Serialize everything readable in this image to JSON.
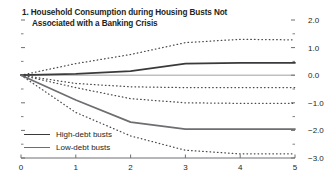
{
  "chart_data": {
    "type": "line",
    "title": "1. Household Consumption during Housing Busts Not Associated with a Banking Crisis",
    "title_line1": "1. Household Consumption during Housing Busts Not",
    "title_line2": "Associated with a Banking Crisis",
    "xlabel": "",
    "ylabel": "",
    "x": [
      0,
      1,
      2,
      3,
      4,
      5
    ],
    "xlim": [
      0,
      5
    ],
    "ylim": [
      -3.0,
      2.0
    ],
    "xticks": [
      "0",
      "1",
      "2",
      "3",
      "4",
      "5"
    ],
    "yticks": [
      "2.0",
      "1.0",
      "0.0",
      "-1.0",
      "-2.0",
      "-3.0"
    ],
    "ytick_values": [
      2.0,
      1.0,
      0.0,
      -1.0,
      -2.0,
      -3.0
    ],
    "grid": false,
    "legend_position": "lower-left",
    "y_axis_side": "right",
    "zero_line": 0.0,
    "series": [
      {
        "name": "High-debt busts",
        "style": "solid",
        "color": "#3a3a3c",
        "values": [
          0.0,
          0.05,
          0.15,
          0.42,
          0.45,
          0.45
        ]
      },
      {
        "name": "High-debt busts upper confidence band",
        "style": "dotted",
        "color": "#4a4a4c",
        "legend": false,
        "values": [
          0.0,
          0.42,
          0.75,
          1.18,
          1.3,
          1.28
        ]
      },
      {
        "name": "High-debt busts lower confidence band",
        "style": "dotted",
        "color": "#4a4a4c",
        "legend": false,
        "values": [
          0.0,
          -0.3,
          -0.42,
          -0.45,
          -0.45,
          -0.45
        ]
      },
      {
        "name": "Low-debt busts",
        "style": "solid",
        "color": "#6e6e72",
        "values": [
          0.0,
          -0.9,
          -1.7,
          -1.95,
          -1.95,
          -1.95
        ]
      },
      {
        "name": "Low-debt busts upper confidence band",
        "style": "dotted",
        "color": "#4a4a4c",
        "legend": false,
        "values": [
          0.0,
          -0.45,
          -0.85,
          -1.0,
          -1.02,
          -1.02
        ]
      },
      {
        "name": "Low-debt busts lower confidence band",
        "style": "dotted",
        "color": "#4a4a4c",
        "legend": false,
        "values": [
          0.0,
          -1.35,
          -2.2,
          -2.72,
          -2.85,
          -2.85
        ]
      }
    ]
  },
  "legend": {
    "items": [
      {
        "label": "High-debt busts"
      },
      {
        "label": "Low-debt busts"
      }
    ]
  },
  "colors": {
    "axis": "#6f6f73",
    "zero_line": "#bfbfc2",
    "high_debt": "#3a3a3c",
    "low_debt": "#6e6e72",
    "confidence_band": "#4a4a4c",
    "text": "#231f20",
    "background": "#ffffff"
  }
}
